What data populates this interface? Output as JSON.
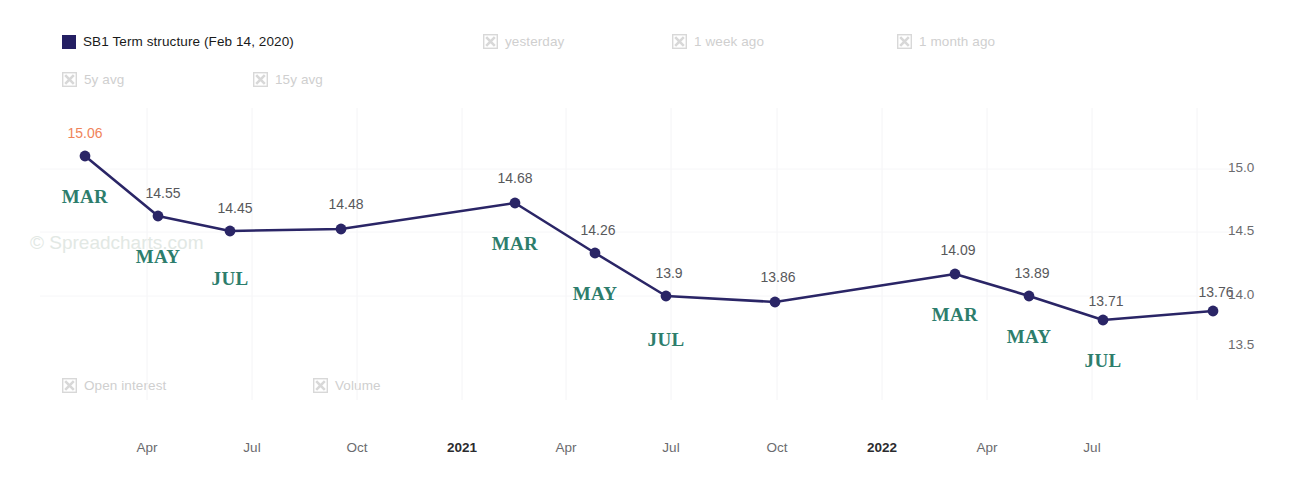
{
  "legend": {
    "top": [
      {
        "label": "SB1 Term structure (Feb 14, 2020)",
        "state": "active",
        "marker": "swatch",
        "color": "#241f63",
        "x": 62,
        "y": 34
      },
      {
        "label": "yesterday",
        "state": "off",
        "marker": "x-icon",
        "x": 483,
        "y": 34
      },
      {
        "label": "1 week ago",
        "state": "off",
        "marker": "x-icon",
        "x": 672,
        "y": 34
      },
      {
        "label": "1 month ago",
        "state": "off",
        "marker": "x-icon",
        "x": 897,
        "y": 34
      },
      {
        "label": "5y avg",
        "state": "off",
        "marker": "x-icon",
        "x": 62,
        "y": 72
      },
      {
        "label": "15y avg",
        "state": "off",
        "marker": "x-icon",
        "x": 253,
        "y": 72
      }
    ],
    "bottom": [
      {
        "label": "Open interest",
        "state": "off",
        "marker": "x-icon",
        "x": 62,
        "y": 378
      },
      {
        "label": "Volume",
        "state": "off",
        "marker": "x-icon",
        "x": 313,
        "y": 378
      }
    ]
  },
  "watermark": {
    "text": "© Spreadcharts.com",
    "x": 30,
    "y": 232
  },
  "chart_data": {
    "type": "line",
    "title": "SB1 Term structure (Feb 14, 2020)",
    "xlabel": "",
    "ylabel": "",
    "ylim": [
      13.35,
      15.18
    ],
    "grid": true,
    "legend_position": "top",
    "series_color": "#2a2566",
    "series": [
      {
        "name": "SB1 Term structure (Feb 14, 2020)",
        "points": [
          {
            "value": "15.06",
            "month": "MAR",
            "px": 85,
            "py": 156,
            "label_dx": 0,
            "label_dy": -31,
            "month_dy": 30,
            "highlight": true
          },
          {
            "value": "14.55",
            "month": "MAY",
            "px": 158,
            "py": 216,
            "label_dx": 5,
            "label_dy": -31,
            "month_dy": 30,
            "highlight": false
          },
          {
            "value": "14.45",
            "month": "JUL",
            "px": 230,
            "py": 231,
            "label_dx": 5,
            "label_dy": -31,
            "month_dy": 37,
            "highlight": false
          },
          {
            "value": "14.48",
            "month": "",
            "px": 341,
            "py": 229,
            "label_dx": 5,
            "label_dy": -33,
            "month_dy": 0,
            "highlight": false
          },
          {
            "value": "14.68",
            "month": "MAR",
            "px": 515,
            "py": 203,
            "label_dx": 0,
            "label_dy": -33,
            "month_dy": 30,
            "highlight": false
          },
          {
            "value": "14.26",
            "month": "MAY",
            "px": 595,
            "py": 253,
            "label_dx": 3,
            "label_dy": -31,
            "month_dy": 30,
            "highlight": false
          },
          {
            "value": "13.9",
            "month": "JUL",
            "px": 666,
            "py": 296,
            "label_dx": 3,
            "label_dy": -31,
            "month_dy": 33,
            "highlight": false
          },
          {
            "value": "13.86",
            "month": "",
            "px": 775,
            "py": 302,
            "label_dx": 3,
            "label_dy": -33,
            "month_dy": 0,
            "highlight": false
          },
          {
            "value": "14.09",
            "month": "MAR",
            "px": 955,
            "py": 274,
            "label_dx": 3,
            "label_dy": -32,
            "month_dy": 30,
            "highlight": false
          },
          {
            "value": "13.89",
            "month": "MAY",
            "px": 1029,
            "py": 296,
            "label_dx": 3,
            "label_dy": -31,
            "month_dy": 30,
            "highlight": false
          },
          {
            "value": "13.71",
            "month": "JUL",
            "px": 1103,
            "py": 320,
            "label_dx": 3,
            "label_dy": -27,
            "month_dy": 30,
            "highlight": false
          },
          {
            "value": "13.76",
            "month": "",
            "px": 1213,
            "py": 311,
            "label_dx": 3,
            "label_dy": -27,
            "month_dy": 0,
            "highlight": false
          }
        ]
      }
    ],
    "y_ticks": [
      {
        "label": "15.0",
        "py": 169
      },
      {
        "label": "14.5",
        "py": 232
      },
      {
        "label": "14.0",
        "py": 296
      },
      {
        "label": "13.5",
        "py": 346
      }
    ],
    "x_ticks": [
      {
        "label": "Apr",
        "px": 147,
        "bold": false
      },
      {
        "label": "Jul",
        "px": 252,
        "bold": false
      },
      {
        "label": "Oct",
        "px": 357,
        "bold": false
      },
      {
        "label": "2021",
        "px": 462,
        "bold": true
      },
      {
        "label": "Apr",
        "px": 566,
        "bold": false
      },
      {
        "label": "Jul",
        "px": 671,
        "bold": false
      },
      {
        "label": "Oct",
        "px": 777,
        "bold": false
      },
      {
        "label": "2022",
        "px": 882,
        "bold": true
      },
      {
        "label": "Apr",
        "px": 987,
        "bold": false
      },
      {
        "label": "Jul",
        "px": 1092,
        "bold": false
      }
    ],
    "gridlines_x": [
      147,
      252,
      357,
      462,
      566,
      671,
      777,
      882,
      987,
      1092,
      1197
    ],
    "gridlines_y": [
      169,
      232,
      296
    ]
  }
}
